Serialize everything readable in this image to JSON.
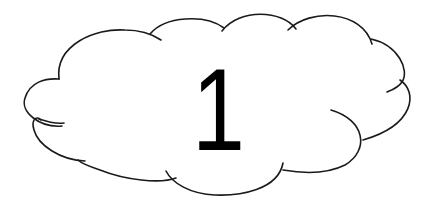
{
  "cloud": {
    "label": "1",
    "stroke_color": "#1a1a1a",
    "text_color": "#000000",
    "background": "#ffffff"
  }
}
